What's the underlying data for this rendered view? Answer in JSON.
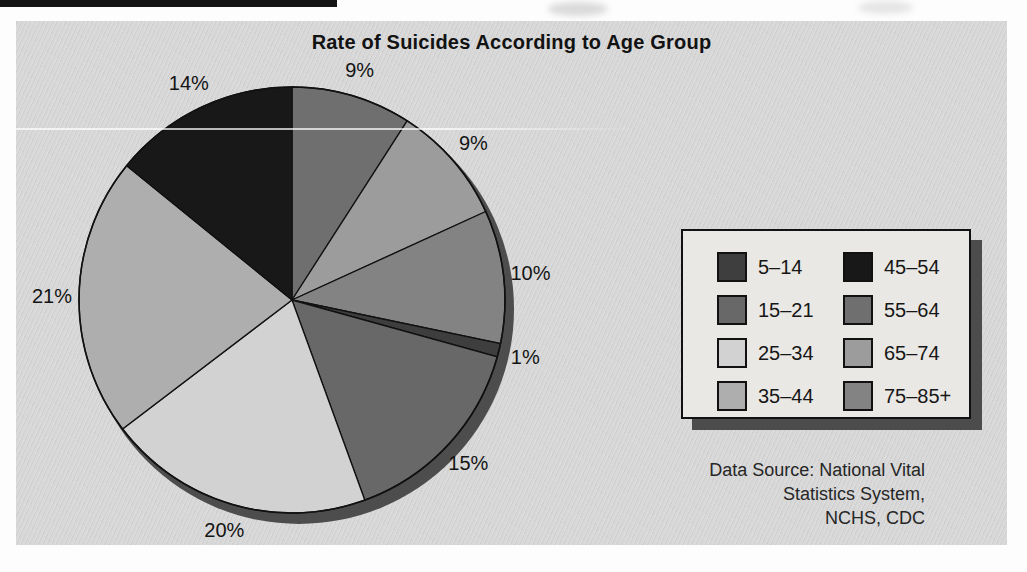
{
  "page": {
    "background": "#fdfdfd",
    "panel_background": "#d8d8d8"
  },
  "chart_data": {
    "type": "pie",
    "title": "Rate of Suicides According to Age Group",
    "value_unit": "%",
    "labels_sum_shown": 99,
    "slices_clockwise_from_top": [
      {
        "category": "55–64",
        "value": 9,
        "display": "9%",
        "color": "#6f6f6f"
      },
      {
        "category": "65–74",
        "value": 9,
        "display": "9%",
        "color": "#9c9c9c"
      },
      {
        "category": "75–85+",
        "value": 10,
        "display": "10%",
        "color": "#838383"
      },
      {
        "category": "5–14",
        "value": 1,
        "display": "1%",
        "color": "#3e3e3e"
      },
      {
        "category": "15–21",
        "value": 15,
        "display": "15%",
        "color": "#686868"
      },
      {
        "category": "25–34",
        "value": 20,
        "display": "20%",
        "color": "#d2d2d2"
      },
      {
        "category": "35–44",
        "value": 21,
        "display": "21%",
        "color": "#aeaeae"
      },
      {
        "category": "45–54",
        "value": 14,
        "display": "14%",
        "color": "#181818"
      }
    ],
    "legend": {
      "position": "right",
      "columns": [
        [
          "5–14",
          "15–21",
          "25–34",
          "35–44"
        ],
        [
          "45–54",
          "55–64",
          "65–74",
          "75–85+"
        ]
      ]
    },
    "source_lines": [
      "Data Source: National Vital",
      "Statistics System,",
      "NCHS, CDC"
    ],
    "shadow_color": "#4d4d4d",
    "outline_color": "#111111"
  }
}
